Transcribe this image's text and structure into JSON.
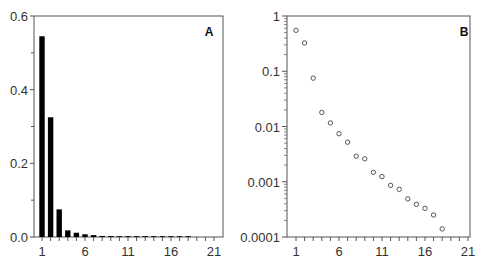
{
  "chart_data": [
    {
      "panel": "A",
      "type": "bar",
      "title": "",
      "xlabel": "",
      "ylabel": "",
      "x": [
        1,
        2,
        3,
        4,
        5,
        6,
        7,
        8,
        9,
        10,
        11,
        12,
        13,
        14,
        15,
        16,
        17,
        18,
        19,
        20,
        21
      ],
      "values": [
        0.545,
        0.325,
        0.075,
        0.018,
        0.0116,
        0.0074,
        0.0052,
        0.0029,
        0.0026,
        0.0015,
        0.0012,
        0.0009,
        0.0007,
        0.0005,
        0.0004,
        0.0003,
        0.00025,
        0.00014,
        0,
        0,
        0
      ],
      "xlim": [
        0,
        21.5
      ],
      "ylim": [
        0,
        0.6
      ],
      "xticks": [
        "1",
        "6",
        "11",
        "16",
        "21"
      ],
      "yticks": [
        "0.0",
        "0.2",
        "0.4",
        "0.6"
      ],
      "y_minor_ticks": [
        0.1,
        0.3,
        0.5
      ],
      "grid": false,
      "bar_color": "#000000"
    },
    {
      "panel": "B",
      "type": "scatter",
      "yscale": "log",
      "title": "",
      "xlabel": "",
      "ylabel": "",
      "x": [
        1,
        2,
        3,
        4,
        5,
        6,
        7,
        8,
        9,
        10,
        11,
        12,
        13,
        14,
        15,
        16,
        17,
        18
      ],
      "values": [
        0.55,
        0.325,
        0.075,
        0.018,
        0.0116,
        0.0074,
        0.0052,
        0.0029,
        0.0026,
        0.00148,
        0.00124,
        0.00086,
        0.00073,
        0.00049,
        0.00039,
        0.00033,
        0.00025,
        0.00014
      ],
      "xlim": [
        0,
        21.5
      ],
      "ylim": [
        0.0001,
        1
      ],
      "xticks": [
        "1",
        "6",
        "11",
        "16",
        "21"
      ],
      "yticks": [
        "0.0001",
        "0.001",
        "0.01",
        "0.1",
        "1"
      ],
      "grid": false,
      "marker": "open-circle"
    }
  ],
  "panels": {
    "a": {
      "label": "A",
      "ytick_labels": [
        "0.0",
        "0.2",
        "0.4",
        "0.6"
      ],
      "xtick_labels": [
        "1",
        "6",
        "11",
        "16",
        "21"
      ]
    },
    "b": {
      "label": "B",
      "ytick_labels": [
        "0.0001",
        "0.001",
        "0.01",
        "0.1",
        "1"
      ],
      "xtick_labels": [
        "1",
        "6",
        "11",
        "16",
        "21"
      ]
    }
  }
}
